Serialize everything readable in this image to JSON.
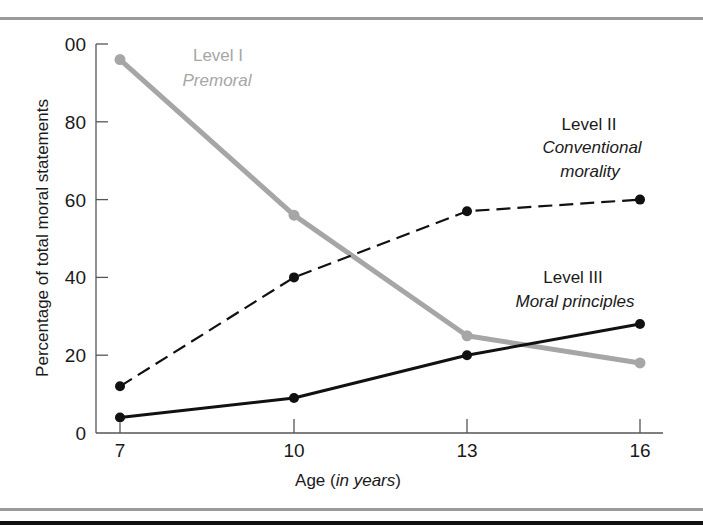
{
  "chart_data": {
    "type": "line",
    "title": "",
    "xlabel": "Age (in years)",
    "xlabel_parts": {
      "plain": "Age (",
      "italic": "in years",
      "close": ")"
    },
    "ylabel": "Percentage of total moral statements",
    "x": [
      7,
      10,
      13,
      16
    ],
    "xticks": [
      "7",
      "10",
      "13",
      "16"
    ],
    "yticks": [
      "0",
      "20",
      "40",
      "60",
      "80",
      "00"
    ],
    "ytick_values": [
      0,
      20,
      40,
      60,
      80,
      100
    ],
    "ylim": [
      0,
      100
    ],
    "grid": false,
    "series": [
      {
        "name": "Level I",
        "subtitle": "Premoral",
        "style": "solid-thick-gray",
        "color": "#a6a6a6",
        "values": [
          96,
          56,
          25,
          18
        ]
      },
      {
        "name": "Level II",
        "subtitle": "Conventional morality",
        "subtitle_lines": [
          "Conventional",
          "morality"
        ],
        "style": "dashed-black",
        "color": "#111111",
        "values": [
          12,
          40,
          57,
          60
        ]
      },
      {
        "name": "Level III",
        "subtitle": "Moral principles",
        "style": "solid-black",
        "color": "#111111",
        "values": [
          4,
          9,
          20,
          28
        ]
      }
    ],
    "annotations": [
      {
        "series": "Level I",
        "position": "upper-left near age 10"
      },
      {
        "series": "Level II",
        "position": "right, above dashed line"
      },
      {
        "series": "Level III",
        "position": "right, above solid line"
      }
    ]
  },
  "labels": {
    "level1_title": "Level I",
    "level1_sub": "Premoral",
    "level2_title": "Level II",
    "level2_sub1": "Conventional",
    "level2_sub2": "morality",
    "level3_title": "Level III",
    "level3_sub": "Moral principles"
  }
}
